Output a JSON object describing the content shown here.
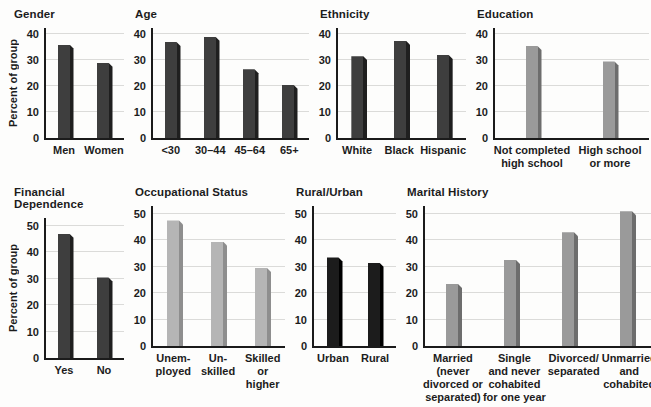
{
  "figure": {
    "ylabel_left_charts": "Percent of group",
    "background": "#fdfdfc",
    "axis_color": "#1b1b1b",
    "gridline_color": "#dbdbd9"
  },
  "bar_styles": {
    "dark": {
      "fill": "#3e3e3e",
      "edge": "#1f1f1f"
    },
    "black": {
      "fill": "#1c1c1c",
      "edge": "#000000"
    },
    "gray": {
      "fill": "#9a9a9a",
      "edge": "#6d6d6d"
    },
    "light": {
      "fill": "#b5b5b5",
      "edge": "#8e8e8e"
    }
  },
  "chart_data": [
    {
      "type": "bar",
      "title": "Gender",
      "ylabel": "Percent of group",
      "ylim": [
        0,
        40
      ],
      "yticks": [
        0,
        10,
        20,
        30,
        40
      ],
      "grid": true,
      "legend": false,
      "categories": [
        "Men",
        "Women"
      ],
      "values": [
        36,
        29
      ],
      "bar_style": "dark"
    },
    {
      "type": "bar",
      "title": "Age",
      "ylim": [
        0,
        40
      ],
      "yticks": [
        0,
        10,
        20,
        30,
        40
      ],
      "grid": true,
      "legend": false,
      "categories": [
        "<30",
        "30–44",
        "45–64",
        "65+"
      ],
      "values": [
        37,
        39,
        26.5,
        20.5
      ],
      "bar_style": "dark"
    },
    {
      "type": "bar",
      "title": "Ethnicity",
      "ylim": [
        0,
        40
      ],
      "yticks": [
        0,
        10,
        20,
        30,
        40
      ],
      "grid": true,
      "legend": false,
      "categories": [
        "White",
        "Black",
        "Hispanic"
      ],
      "values": [
        31.5,
        37.5,
        32
      ],
      "bar_style": "dark"
    },
    {
      "type": "bar",
      "title": "Education",
      "ylim": [
        0,
        40
      ],
      "yticks": [
        0,
        10,
        20,
        30,
        40
      ],
      "grid": true,
      "legend": false,
      "categories": [
        "Not completed\nhigh school",
        "High school\nor more"
      ],
      "values": [
        35.5,
        29.5
      ],
      "bar_style": "gray"
    },
    {
      "type": "bar",
      "title": "Financial Dependence",
      "ylabel": "Percent of group",
      "ylim": [
        0,
        50
      ],
      "yticks": [
        0,
        10,
        20,
        30,
        40,
        50
      ],
      "grid": true,
      "legend": false,
      "categories": [
        "Yes",
        "No"
      ],
      "values": [
        47,
        30.5
      ],
      "bar_style": "dark"
    },
    {
      "type": "bar",
      "title": "Occupational Status",
      "ylim": [
        0,
        50
      ],
      "yticks": [
        0,
        10,
        20,
        30,
        40,
        50
      ],
      "grid": true,
      "legend": false,
      "categories": [
        "Unem-\nployed",
        "Un-\nskilled",
        "Skilled\nor\nhigher"
      ],
      "values": [
        47.5,
        39.5,
        29.5
      ],
      "bar_style": "light"
    },
    {
      "type": "bar",
      "title": "Rural/Urban",
      "ylim": [
        0,
        50
      ],
      "yticks": [
        0,
        10,
        20,
        30,
        40,
        50
      ],
      "grid": true,
      "legend": false,
      "categories": [
        "Urban",
        "Rural"
      ],
      "values": [
        33.5,
        31.5
      ],
      "bar_style": "black"
    },
    {
      "type": "bar",
      "title": "Marital History",
      "ylim": [
        0,
        50
      ],
      "yticks": [
        0,
        10,
        20,
        30,
        40,
        50
      ],
      "grid": true,
      "legend": false,
      "categories": [
        "Married\n(never\ndivorced or\nseparated)",
        "Single\nand never\ncohabited\nfor one year",
        "Divorced/\nseparated",
        "Unmarried\nand\ncohabited"
      ],
      "values": [
        23.5,
        32.5,
        43,
        51
      ],
      "bar_style": "gray"
    }
  ]
}
